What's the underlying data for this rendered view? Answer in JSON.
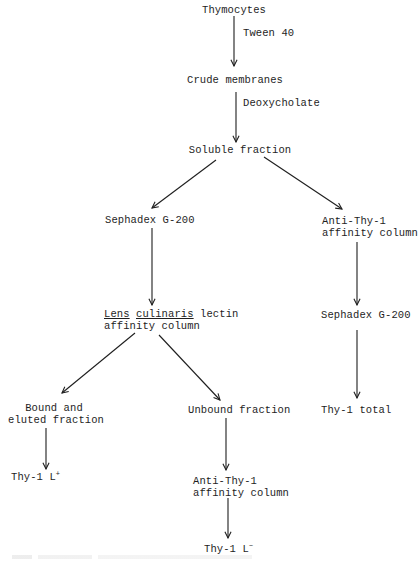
{
  "diagram": {
    "type": "flowchart",
    "nodes": {
      "thymocytes": {
        "label": "Thymocytes"
      },
      "crude_membranes": {
        "label": "Crude membranes"
      },
      "soluble_fraction": {
        "label": "Soluble fraction"
      },
      "sephadex_left": {
        "label": "Sephadex G-200"
      },
      "anti_thy1_right": {
        "line1": "Anti-Thy-1",
        "line2": "affinity column"
      },
      "lens_column": {
        "word1": "Lens",
        "word2": "culinaris",
        "word3": "lectin",
        "line2": "affinity column"
      },
      "sephadex_right": {
        "label": "Sephadex G-200"
      },
      "bound": {
        "line1": "Bound and",
        "line2": "eluted fraction"
      },
      "unbound": {
        "label": "Unbound fraction"
      },
      "thy1_total": {
        "label": "Thy-1 total"
      },
      "thy1_lplus": {
        "base": "Thy-1 L",
        "sup": "+"
      },
      "anti_thy1_lower": {
        "line1": "Anti-Thy-1",
        "line2": "affinity column"
      },
      "thy1_lminus": {
        "base": "Thy-1 L",
        "sup": "−"
      }
    },
    "edge_labels": {
      "tween": "Tween 40",
      "deoxycholate": "Deoxycholate"
    },
    "edges": [
      {
        "from": "Thymocytes",
        "to": "Crude membranes",
        "label": "Tween 40"
      },
      {
        "from": "Crude membranes",
        "to": "Soluble fraction",
        "label": "Deoxycholate"
      },
      {
        "from": "Soluble fraction",
        "to": "Sephadex G-200"
      },
      {
        "from": "Soluble fraction",
        "to": "Anti-Thy-1 affinity column"
      },
      {
        "from": "Sephadex G-200",
        "to": "Lens culinaris lectin affinity column"
      },
      {
        "from": "Anti-Thy-1 affinity column",
        "to": "Sephadex G-200 (right)"
      },
      {
        "from": "Lens culinaris lectin affinity column",
        "to": "Bound and eluted fraction"
      },
      {
        "from": "Lens culinaris lectin affinity column",
        "to": "Unbound fraction"
      },
      {
        "from": "Sephadex G-200 (right)",
        "to": "Thy-1 total"
      },
      {
        "from": "Bound and eluted fraction",
        "to": "Thy-1 L+"
      },
      {
        "from": "Unbound fraction",
        "to": "Anti-Thy-1 affinity column (lower)"
      },
      {
        "from": "Anti-Thy-1 affinity column (lower)",
        "to": "Thy-1 L-"
      }
    ],
    "colors": {
      "ink": "#1e1e1e",
      "background": "#ffffff"
    }
  }
}
